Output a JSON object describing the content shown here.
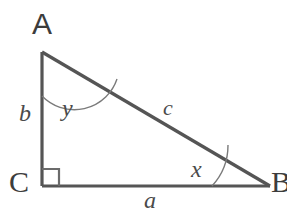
{
  "diagram": {
    "background_color": "#ffffff",
    "stroke_color": "#555555",
    "thin_stroke_color": "#6b6b6b",
    "text_color": "#3c3c3c",
    "vertices": [
      {
        "id": "A",
        "label": "A",
        "x": 42,
        "y": 52
      },
      {
        "id": "C",
        "label": "C",
        "x": 42,
        "y": 186
      },
      {
        "id": "B",
        "label": "B",
        "x": 270,
        "y": 186
      }
    ],
    "sides": [
      {
        "id": "b",
        "label": "b",
        "from": "A",
        "to": "C",
        "role": "vertical-leg"
      },
      {
        "id": "a",
        "label": "a",
        "from": "C",
        "to": "B",
        "role": "base-leg"
      },
      {
        "id": "c",
        "label": "c",
        "from": "A",
        "to": "B",
        "role": "hypotenuse"
      }
    ],
    "angles": [
      {
        "id": "y",
        "label": "y",
        "at": "A",
        "marker": "arc"
      },
      {
        "id": "x",
        "label": "x",
        "at": "B",
        "marker": "arc"
      },
      {
        "id": "C",
        "label": "",
        "at": "C",
        "marker": "right-angle-square"
      }
    ]
  }
}
